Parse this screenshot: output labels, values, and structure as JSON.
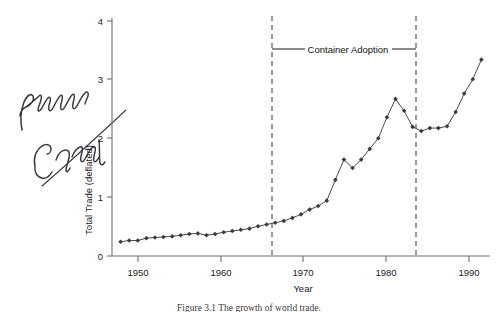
{
  "figure": {
    "caption": "Figure 3.1  The growth of world trade.",
    "handwritten_note": "Panama Canal"
  },
  "chart_data": {
    "type": "line",
    "title": "",
    "xlabel": "Year",
    "ylabel": "Total Trade (deflated)",
    "xlim": [
      1947,
      1991
    ],
    "ylim": [
      0,
      4
    ],
    "xticks": [
      1950,
      1960,
      1970,
      1980,
      1990
    ],
    "xtick_labels": [
      "1950",
      "1960",
      "1970",
      "1980",
      "1990"
    ],
    "yticks": [
      0,
      1,
      2,
      3,
      4
    ],
    "ytick_labels": [
      "0",
      "1",
      "2",
      "3",
      "4"
    ],
    "grid": false,
    "legend": null,
    "marker": "diamond",
    "x": [
      1948,
      1949,
      1950,
      1951,
      1952,
      1953,
      1954,
      1955,
      1956,
      1957,
      1958,
      1959,
      1960,
      1961,
      1962,
      1963,
      1964,
      1965,
      1966,
      1967,
      1968,
      1969,
      1970,
      1971,
      1972,
      1973,
      1974,
      1975,
      1976,
      1977,
      1978,
      1979,
      1980,
      1981,
      1982,
      1983,
      1984,
      1985,
      1986,
      1987,
      1988,
      1989,
      1990
    ],
    "values": [
      0.24,
      0.26,
      0.26,
      0.3,
      0.31,
      0.32,
      0.33,
      0.35,
      0.37,
      0.38,
      0.35,
      0.37,
      0.4,
      0.42,
      0.44,
      0.46,
      0.5,
      0.53,
      0.56,
      0.59,
      0.64,
      0.7,
      0.78,
      0.84,
      0.93,
      1.28,
      1.62,
      1.48,
      1.62,
      1.8,
      1.98,
      2.33,
      2.64,
      2.44,
      2.17,
      2.1,
      2.15,
      2.15,
      2.18,
      2.42,
      2.73,
      2.97,
      3.3
    ],
    "annotations": [
      {
        "label": "Container Adoption",
        "type": "span-between-vertical-lines",
        "x_start": 1966,
        "x_end": 1983.5,
        "y": 3.5
      },
      {
        "label": "Panama Canal",
        "type": "handwritten-margin-note"
      }
    ],
    "event_lines": [
      {
        "x": 1966,
        "style": "dashed"
      },
      {
        "x": 1983.5,
        "style": "dashed"
      }
    ]
  }
}
